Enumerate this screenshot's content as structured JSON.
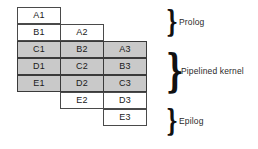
{
  "diagram": {
    "grid": {
      "columns": 3,
      "rows": 7,
      "row_height_px": 17,
      "cell_width_px": 44,
      "shaded_color": "#c9c9c9",
      "unshaded_color": "#ffffff",
      "border_color": "#4a4a4a"
    },
    "rows": [
      {
        "shaded": false,
        "cells": [
          {
            "label": "A1",
            "empty": false
          },
          {
            "label": "",
            "empty": true
          },
          {
            "label": "",
            "empty": true
          }
        ]
      },
      {
        "shaded": false,
        "cells": [
          {
            "label": "B1",
            "empty": false
          },
          {
            "label": "A2",
            "empty": false
          },
          {
            "label": "",
            "empty": true
          }
        ]
      },
      {
        "shaded": true,
        "cells": [
          {
            "label": "C1",
            "empty": false
          },
          {
            "label": "B2",
            "empty": false
          },
          {
            "label": "A3",
            "empty": false
          }
        ]
      },
      {
        "shaded": true,
        "cells": [
          {
            "label": "D1",
            "empty": false
          },
          {
            "label": "C2",
            "empty": false
          },
          {
            "label": "B3",
            "empty": false
          }
        ]
      },
      {
        "shaded": true,
        "cells": [
          {
            "label": "E1",
            "empty": false
          },
          {
            "label": "D2",
            "empty": false
          },
          {
            "label": "C3",
            "empty": false
          }
        ]
      },
      {
        "shaded": false,
        "cells": [
          {
            "label": "",
            "empty": true
          },
          {
            "label": "E2",
            "empty": false
          },
          {
            "label": "D3",
            "empty": false
          }
        ]
      },
      {
        "shaded": false,
        "cells": [
          {
            "label": "",
            "empty": true
          },
          {
            "label": "",
            "empty": true
          },
          {
            "label": "E3",
            "empty": false
          }
        ]
      }
    ],
    "phases": [
      {
        "id": "prolog",
        "brace": "}",
        "label": "Prolog"
      },
      {
        "id": "kernel",
        "brace": "}",
        "label": "Pipelined kernel"
      },
      {
        "id": "epilog",
        "brace": "}",
        "label": "Epilog"
      }
    ]
  }
}
